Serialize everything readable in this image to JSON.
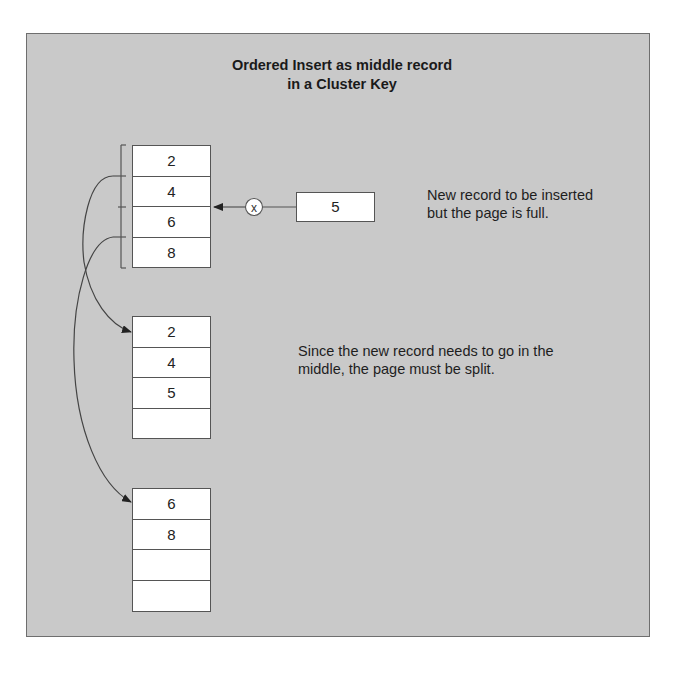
{
  "title": {
    "line1": "Ordered Insert as middle record",
    "line2": "in a Cluster Key"
  },
  "original_page": {
    "records": [
      "2",
      "4",
      "6",
      "8"
    ]
  },
  "new_record": {
    "value": "5",
    "blocked_marker": "x"
  },
  "notes": {
    "insert_line1": "New record to be inserted",
    "insert_line2": "but the page is full.",
    "split_line1": "Since the new record needs to go in the",
    "split_line2": "middle, the page must be split."
  },
  "split_page_1": {
    "records": [
      "2",
      "4",
      "5",
      ""
    ]
  },
  "split_page_2": {
    "records": [
      "6",
      "8",
      "",
      ""
    ]
  },
  "colors": {
    "panel_background": "#c9c9c9",
    "box_fill": "#ffffff",
    "line": "#444444"
  }
}
